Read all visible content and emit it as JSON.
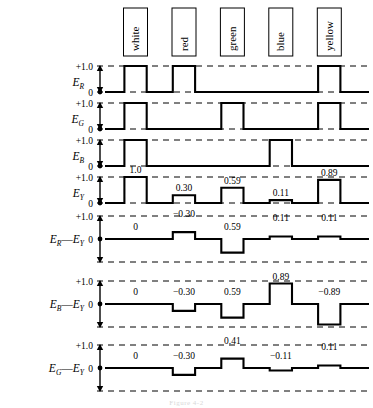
{
  "figure": {
    "caption": "Figure 4-2",
    "color_bars": [
      "white",
      "red",
      "green",
      "blue",
      "yellow"
    ],
    "axis_ticks": {
      "high": "+1.0",
      "zero": "0"
    }
  },
  "rows": [
    {
      "id": "ER",
      "label_main": "E",
      "label_sub": "R",
      "label_full": "E_R",
      "ticks": [
        "+1.0",
        "0"
      ],
      "bipolar": false,
      "levels": [
        1.0,
        1.0,
        0.0,
        0.0,
        1.0
      ],
      "value_labels": []
    },
    {
      "id": "EG",
      "label_main": "E",
      "label_sub": "G",
      "label_full": "E_G",
      "ticks": [
        "+1.0",
        "0"
      ],
      "bipolar": false,
      "levels": [
        1.0,
        0.0,
        1.0,
        0.0,
        1.0
      ],
      "value_labels": []
    },
    {
      "id": "EB",
      "label_main": "E",
      "label_sub": "B",
      "label_full": "E_B",
      "ticks": [
        "+1.0",
        "0"
      ],
      "bipolar": false,
      "levels": [
        1.0,
        0.0,
        0.0,
        1.0,
        0.0
      ],
      "value_labels": []
    },
    {
      "id": "EY",
      "label_main": "E",
      "label_sub": "Y",
      "label_full": "E_Y",
      "ticks": [
        "+1.0",
        "0"
      ],
      "bipolar": false,
      "levels": [
        1.0,
        0.3,
        0.59,
        0.11,
        0.89
      ],
      "value_labels": [
        "1.0",
        "0.30",
        "0.59",
        "0.11",
        "0.89"
      ]
    },
    {
      "id": "ER-EY",
      "label_main": "E",
      "label_sub": "R",
      "label_main2": "E",
      "label_sub2": "Y",
      "label_full": "E_R—E_Y",
      "ticks": [
        "+1.0",
        "0"
      ],
      "bipolar": true,
      "levels": [
        0.0,
        0.3,
        -0.59,
        0.11,
        0.11
      ],
      "value_labels": [
        "0",
        "−0.30",
        "0.59",
        "0.11",
        "0.11"
      ]
    },
    {
      "id": "EB-EY",
      "label_main": "E",
      "label_sub": "B",
      "label_main2": "E",
      "label_sub2": "Y",
      "label_full": "E_B—E_Y",
      "ticks": [
        "+1.0",
        "0"
      ],
      "bipolar": true,
      "levels": [
        0.0,
        -0.3,
        -0.59,
        0.89,
        -0.89
      ],
      "value_labels": [
        "0",
        "−0.30",
        "0.59",
        "0.89",
        "−0.89"
      ]
    },
    {
      "id": "EG-EY",
      "label_main": "E",
      "label_sub": "G",
      "label_main2": "E",
      "label_sub2": "Y",
      "label_full": "E_G—E_Y",
      "ticks": [
        "+1.0",
        "0"
      ],
      "bipolar": true,
      "levels": [
        0.0,
        -0.3,
        0.41,
        -0.11,
        0.11
      ],
      "value_labels": [
        "0",
        "−0.30",
        "0.41",
        "−0.11",
        "0.11"
      ]
    }
  ],
  "chart_data": {
    "type": "line",
    "xlabel": "",
    "ylabel": "",
    "categories": [
      "white",
      "red",
      "green",
      "blue",
      "yellow"
    ],
    "ylim": [
      -1.0,
      1.0
    ],
    "grid": false,
    "legend": "none",
    "series": [
      {
        "name": "E_R",
        "values": [
          1.0,
          1.0,
          0.0,
          0.0,
          1.0
        ],
        "ylim": [
          0,
          1.0
        ]
      },
      {
        "name": "E_G",
        "values": [
          1.0,
          0.0,
          1.0,
          0.0,
          1.0
        ],
        "ylim": [
          0,
          1.0
        ]
      },
      {
        "name": "E_B",
        "values": [
          1.0,
          0.0,
          0.0,
          1.0,
          0.0
        ],
        "ylim": [
          0,
          1.0
        ]
      },
      {
        "name": "E_Y",
        "values": [
          1.0,
          0.3,
          0.59,
          0.11,
          0.89
        ],
        "ylim": [
          0,
          1.0
        ]
      },
      {
        "name": "E_R−E_Y",
        "values": [
          0.0,
          0.3,
          -0.59,
          0.11,
          0.11
        ],
        "ylim": [
          -1.0,
          1.0
        ]
      },
      {
        "name": "E_B−E_Y",
        "values": [
          0.0,
          -0.3,
          -0.59,
          0.89,
          -0.89
        ],
        "ylim": [
          -1.0,
          1.0
        ]
      },
      {
        "name": "E_G−E_Y",
        "values": [
          0.0,
          -0.3,
          0.41,
          -0.11,
          0.11
        ],
        "ylim": [
          -1.0,
          1.0
        ]
      }
    ]
  }
}
